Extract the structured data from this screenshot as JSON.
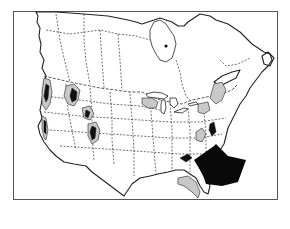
{
  "map": {
    "title": "",
    "region": "North America (United States and Canada)",
    "legend": [],
    "colors": {
      "background": "#ffffff",
      "outline": "#222222",
      "range_gray": "#c8c8c8",
      "range_black": "#111111",
      "arrow": "#0a0a0a"
    },
    "features": [
      {
        "id": "western-mountain-ranges",
        "style": "gray-with-black",
        "area": "Rocky Mountains / Pacific Northwest / Sierra Nevada"
      },
      {
        "id": "great-lakes-range",
        "style": "gray",
        "area": "Great Lakes / Michigan–Ontario"
      },
      {
        "id": "northeast-range",
        "style": "gray",
        "area": "New England / New York / southern Quebec"
      },
      {
        "id": "mid-atlantic-range",
        "style": "gray-with-black",
        "area": "Virginia / Maryland / Appalachians"
      },
      {
        "id": "florida-range",
        "style": "gray",
        "area": "Florida / Georgia coastal plain"
      },
      {
        "id": "arrow-marker",
        "style": "black-arrow",
        "area": "points to the Carolinas (southeastern US)"
      }
    ]
  }
}
